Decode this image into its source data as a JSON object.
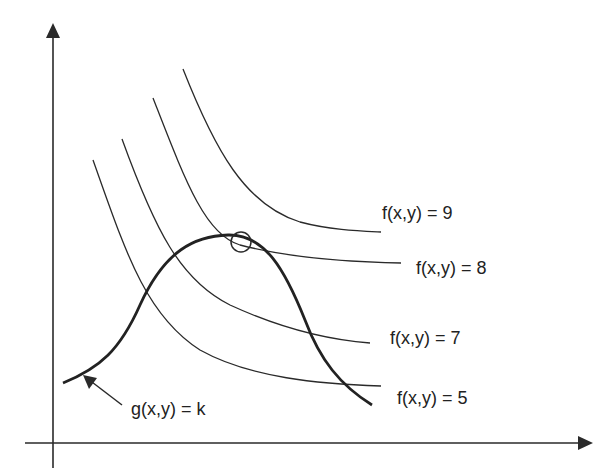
{
  "figure": {
    "type": "level-curves-lagrange",
    "axes": {
      "x_label": "",
      "y_label": ""
    },
    "level_curves": [
      {
        "label": "f(x,y) = 9",
        "value": 9
      },
      {
        "label": "f(x,y) = 8",
        "value": 8
      },
      {
        "label": "f(x,y) = 7",
        "value": 7
      },
      {
        "label": "f(x,y) = 5",
        "value": 5
      }
    ],
    "constraint": {
      "label": "g(x,y) = k"
    },
    "tangent_point_marker": "circle"
  },
  "colors": {
    "line": "#2a2a2a",
    "background": "#ffffff"
  }
}
